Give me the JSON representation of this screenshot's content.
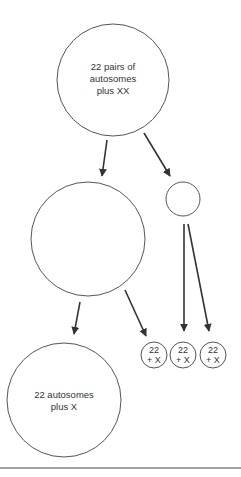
{
  "diagram": {
    "type": "cell-division-meiosis",
    "nodes": [
      {
        "id": "parent",
        "label_lines": [
          "22 pairs of",
          "autosomes",
          "plus XX"
        ],
        "cx": 113,
        "cy": 80,
        "r": 56
      },
      {
        "id": "secondary-large",
        "label_lines": [],
        "cx": 88,
        "cy": 239,
        "r": 57
      },
      {
        "id": "polar-body-1",
        "label_lines": [],
        "cx": 183,
        "cy": 199,
        "r": 17
      },
      {
        "id": "ovum",
        "label_lines": [
          "22 autosomes",
          "plus X"
        ],
        "cx": 64,
        "cy": 400,
        "r": 57
      },
      {
        "id": "polar-body-a",
        "label_lines": [
          "22",
          "+ X"
        ],
        "cx": 154,
        "cy": 355,
        "r": 13
      },
      {
        "id": "polar-body-b",
        "label_lines": [
          "22",
          "+ X"
        ],
        "cx": 183,
        "cy": 355,
        "r": 13
      },
      {
        "id": "polar-body-c",
        "label_lines": [
          "22",
          "+ X"
        ],
        "cx": 213,
        "cy": 355,
        "r": 13
      }
    ],
    "edges": [
      {
        "from": "parent",
        "to": "secondary-large"
      },
      {
        "from": "parent",
        "to": "polar-body-1"
      },
      {
        "from": "secondary-large",
        "to": "ovum"
      },
      {
        "from": "secondary-large",
        "to": "polar-body-a"
      },
      {
        "from": "polar-body-1",
        "to": "polar-body-b"
      },
      {
        "from": "polar-body-1",
        "to": "polar-body-c"
      }
    ]
  },
  "labels": {
    "parent": {
      "l1": "22 pairs of",
      "l2": "autosomes",
      "l3": "plus XX"
    },
    "ovum": {
      "l1": "22 autosomes",
      "l2": "plus X"
    },
    "small": {
      "l1": "22",
      "l2": "+ X"
    }
  }
}
